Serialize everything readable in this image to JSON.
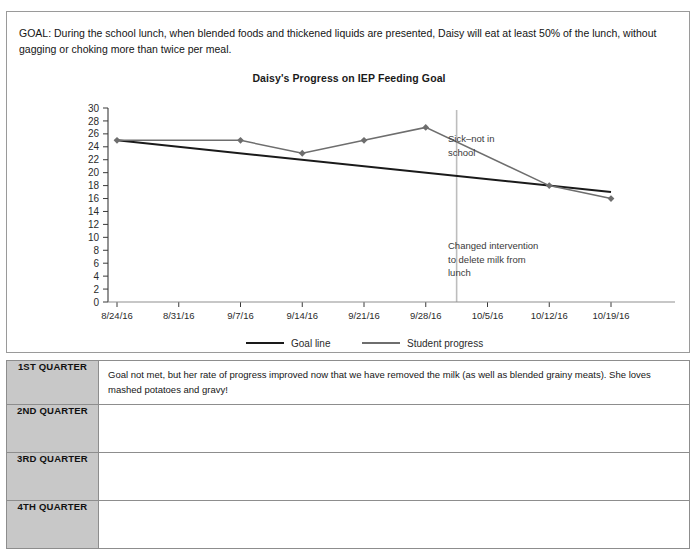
{
  "document": {
    "goal_statement": "GOAL: During the school lunch, when blended foods and thickened liquids are presented, Daisy will eat at least 50% of the lunch, without gagging or choking more than twice per meal."
  },
  "chart_data": {
    "type": "line",
    "title": "Daisy's Progress on IEP Feeding Goal",
    "xlabel": "",
    "ylabel": "",
    "ylim": [
      0,
      30
    ],
    "ytick_step": 2,
    "grid": false,
    "legend_position": "bottom",
    "categories": [
      "8/24/16",
      "8/31/16",
      "9/7/16",
      "9/14/16",
      "9/21/16",
      "9/28/16",
      "10/5/16",
      "10/12/16",
      "10/19/16"
    ],
    "yticks": [
      0,
      2,
      4,
      6,
      8,
      10,
      12,
      14,
      16,
      18,
      20,
      22,
      24,
      26,
      28,
      30
    ],
    "series": [
      {
        "name": "Goal line",
        "color": "#1a1a1a",
        "markers": false,
        "x": [
          "8/24/16",
          "10/19/16"
        ],
        "values": [
          25,
          17
        ]
      },
      {
        "name": "Student progress",
        "color": "#6e6e6e",
        "markers": true,
        "x": [
          "8/24/16",
          "9/7/16",
          "9/14/16",
          "9/21/16",
          "9/28/16",
          "10/12/16",
          "10/19/16"
        ],
        "values": [
          25,
          25,
          23,
          25,
          27,
          18,
          16
        ]
      }
    ],
    "annotations": [
      {
        "text_line1": "Sick–not in",
        "text_line2": "school",
        "text_line3": ""
      },
      {
        "text_line1": "Changed intervention",
        "text_line2": "to delete milk from",
        "text_line3": "lunch"
      }
    ],
    "vertical_marker": {
      "at": "9/28/16-10/5/16",
      "color": "#bdbdbd"
    },
    "legend": [
      {
        "label": "Goal line",
        "color": "#1a1a1a"
      },
      {
        "label": "Student progress",
        "color": "#6e6e6e"
      }
    ]
  },
  "quarters": [
    {
      "label": "1ST QUARTER",
      "note": "Goal not met, but her rate of progress improved now that we have removed the milk (as well as blended grainy meats). She loves mashed potatoes and gravy!"
    },
    {
      "label": "2ND QUARTER",
      "note": ""
    },
    {
      "label": "3RD QUARTER",
      "note": ""
    },
    {
      "label": "4TH QUARTER",
      "note": ""
    }
  ]
}
